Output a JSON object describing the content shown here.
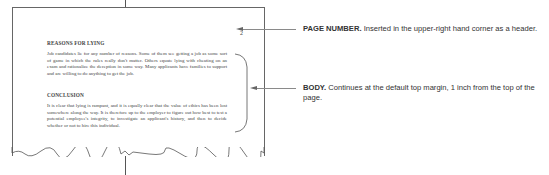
{
  "page": {
    "page_number": "2",
    "sections": [
      {
        "heading": "REASONS FOR LYING",
        "body": "Job candidates lie for any number of reasons. Some of them see getting a job as some sort of game in which the rules really don't matter. Others equate lying with cheating on an exam and rationalize the deception in some way. Many applicants have families to support and are willing to do anything to get the job."
      },
      {
        "heading": "CONCLUSION",
        "body": "It is clear that lying is rampant, and it is equally clear that the value of ethics has been lost somewhere along the way. It is therefore up to the employer to figure out how best to test a potential employee's integrity, to investigate an applicant's history, and then to decide whether or not to hire this individual."
      }
    ]
  },
  "callouts": [
    {
      "title": "PAGE NUMBER.",
      "text": " Inserted in the upper-right hand corner as a header."
    },
    {
      "title": "BODY.",
      "text": " Continues at the default top margin, 1 inch from the top of the page."
    }
  ],
  "colors": {
    "page_border": "#666666",
    "text": "#444444",
    "callout_text": "#333333",
    "arrow": "#8a8a8a"
  }
}
